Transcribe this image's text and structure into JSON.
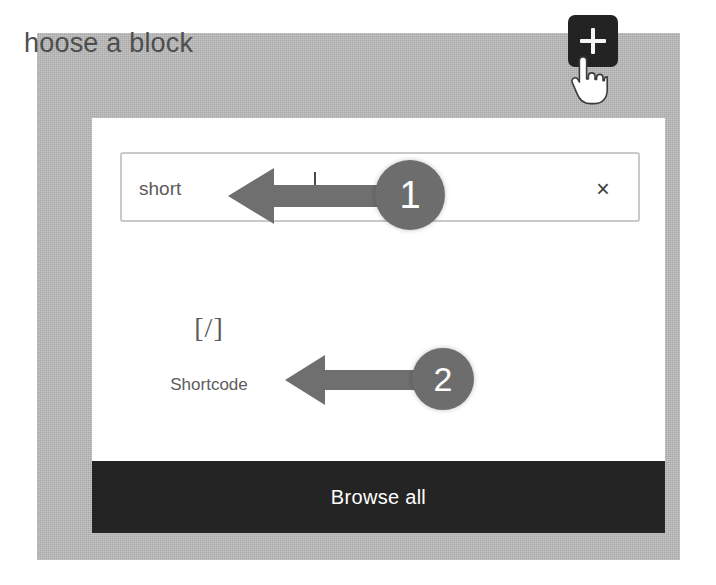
{
  "editor": {
    "title": "hoose a block",
    "inserter_toggle_name": "Add block",
    "plus_icon": "plus-icon",
    "cursor_icon": "pointing-hand-cursor"
  },
  "popover": {
    "search": {
      "value": "short",
      "placeholder": "Search",
      "clear_label": "×"
    },
    "results": [
      {
        "icon_glyph": "[/]",
        "icon_name": "shortcode-icon",
        "label": "Shortcode"
      }
    ],
    "browse_all_label": "Browse all"
  },
  "annotations": [
    {
      "number": "1",
      "points_to": "search-input"
    },
    {
      "number": "2",
      "points_to": "shortcode-block-result"
    }
  ],
  "colors": {
    "backdrop": "#b8b8b8",
    "popover": "#ffffff",
    "dark_bar": "#242424",
    "badge": "#6d6d6d",
    "arrow": "#6f6f6f",
    "text": "#5a5a5a"
  }
}
